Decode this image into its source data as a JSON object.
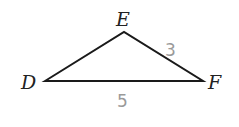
{
  "diagram": {
    "type": "triangle",
    "vertices": [
      {
        "id": "D",
        "label": "D",
        "x": 45,
        "y": 81
      },
      {
        "id": "E",
        "label": "E",
        "x": 124,
        "y": 32
      },
      {
        "id": "F",
        "label": "F",
        "x": 203,
        "y": 81
      }
    ],
    "sides": [
      {
        "from": "E",
        "to": "F",
        "label": "3"
      },
      {
        "from": "D",
        "to": "F",
        "label": "5"
      }
    ],
    "colors": {
      "stroke": "#1a1a1a",
      "vertex_label": "#222222",
      "side_label": "#9a9a9a"
    }
  }
}
